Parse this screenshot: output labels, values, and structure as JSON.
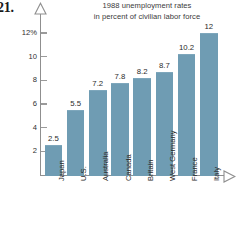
{
  "problem_number": "21.",
  "chart_data": {
    "type": "bar",
    "title": "1988 unemployment rates\nin percent of civilian labor force",
    "title_line1": "1988 unemployment rates",
    "title_line2": "in percent of civilian labor force",
    "xlabel": "",
    "ylabel": "",
    "ylim": [
      0,
      13
    ],
    "grid": false,
    "legend": false,
    "bar_color": "#6f9cb3",
    "axis_color": "#8f8f8f",
    "categories": [
      "Japan",
      "U.S.",
      "Australia",
      "Canada",
      "Britain",
      "West Germany",
      "France",
      "Italy"
    ],
    "values": [
      2.5,
      5.5,
      7.2,
      7.8,
      8.2,
      8.7,
      10.2,
      12
    ],
    "value_labels": [
      "2.5",
      "5.5",
      "7.2",
      "7.8",
      "8.2",
      "8.7",
      "10.2",
      "12"
    ],
    "y_ticks": [
      2,
      4,
      6,
      8,
      10,
      12
    ],
    "y_tick_labels": [
      "2",
      "4",
      "6",
      "8",
      "10",
      "12%"
    ]
  }
}
